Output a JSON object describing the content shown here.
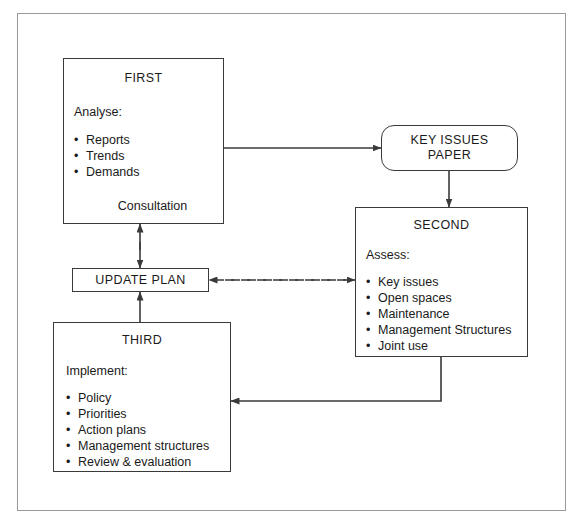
{
  "diagram": {
    "nodes": {
      "first": {
        "title": "FIRST",
        "lead": "Analyse:",
        "bullets": [
          "Reports",
          "Trends",
          "Demands"
        ],
        "footer": "Consultation"
      },
      "key_issues": {
        "line1": "KEY ISSUES",
        "line2": "PAPER"
      },
      "second": {
        "title": "SECOND",
        "lead": "Assess:",
        "bullets": [
          "Key issues",
          "Open spaces",
          "Maintenance",
          "Management Structures",
          "Joint use"
        ]
      },
      "update_plan": {
        "title": "UPDATE PLAN"
      },
      "third": {
        "title": "THIRD",
        "lead": "Implement:",
        "bullets": [
          "Policy",
          "Priorities",
          "Action plans",
          "Management structures",
          "Review & evaluation"
        ]
      }
    },
    "colors": {
      "stroke": "#3a3a3a",
      "frame": "#9a9a9a",
      "background": "#ffffff",
      "text": "#1a1a1a"
    }
  }
}
